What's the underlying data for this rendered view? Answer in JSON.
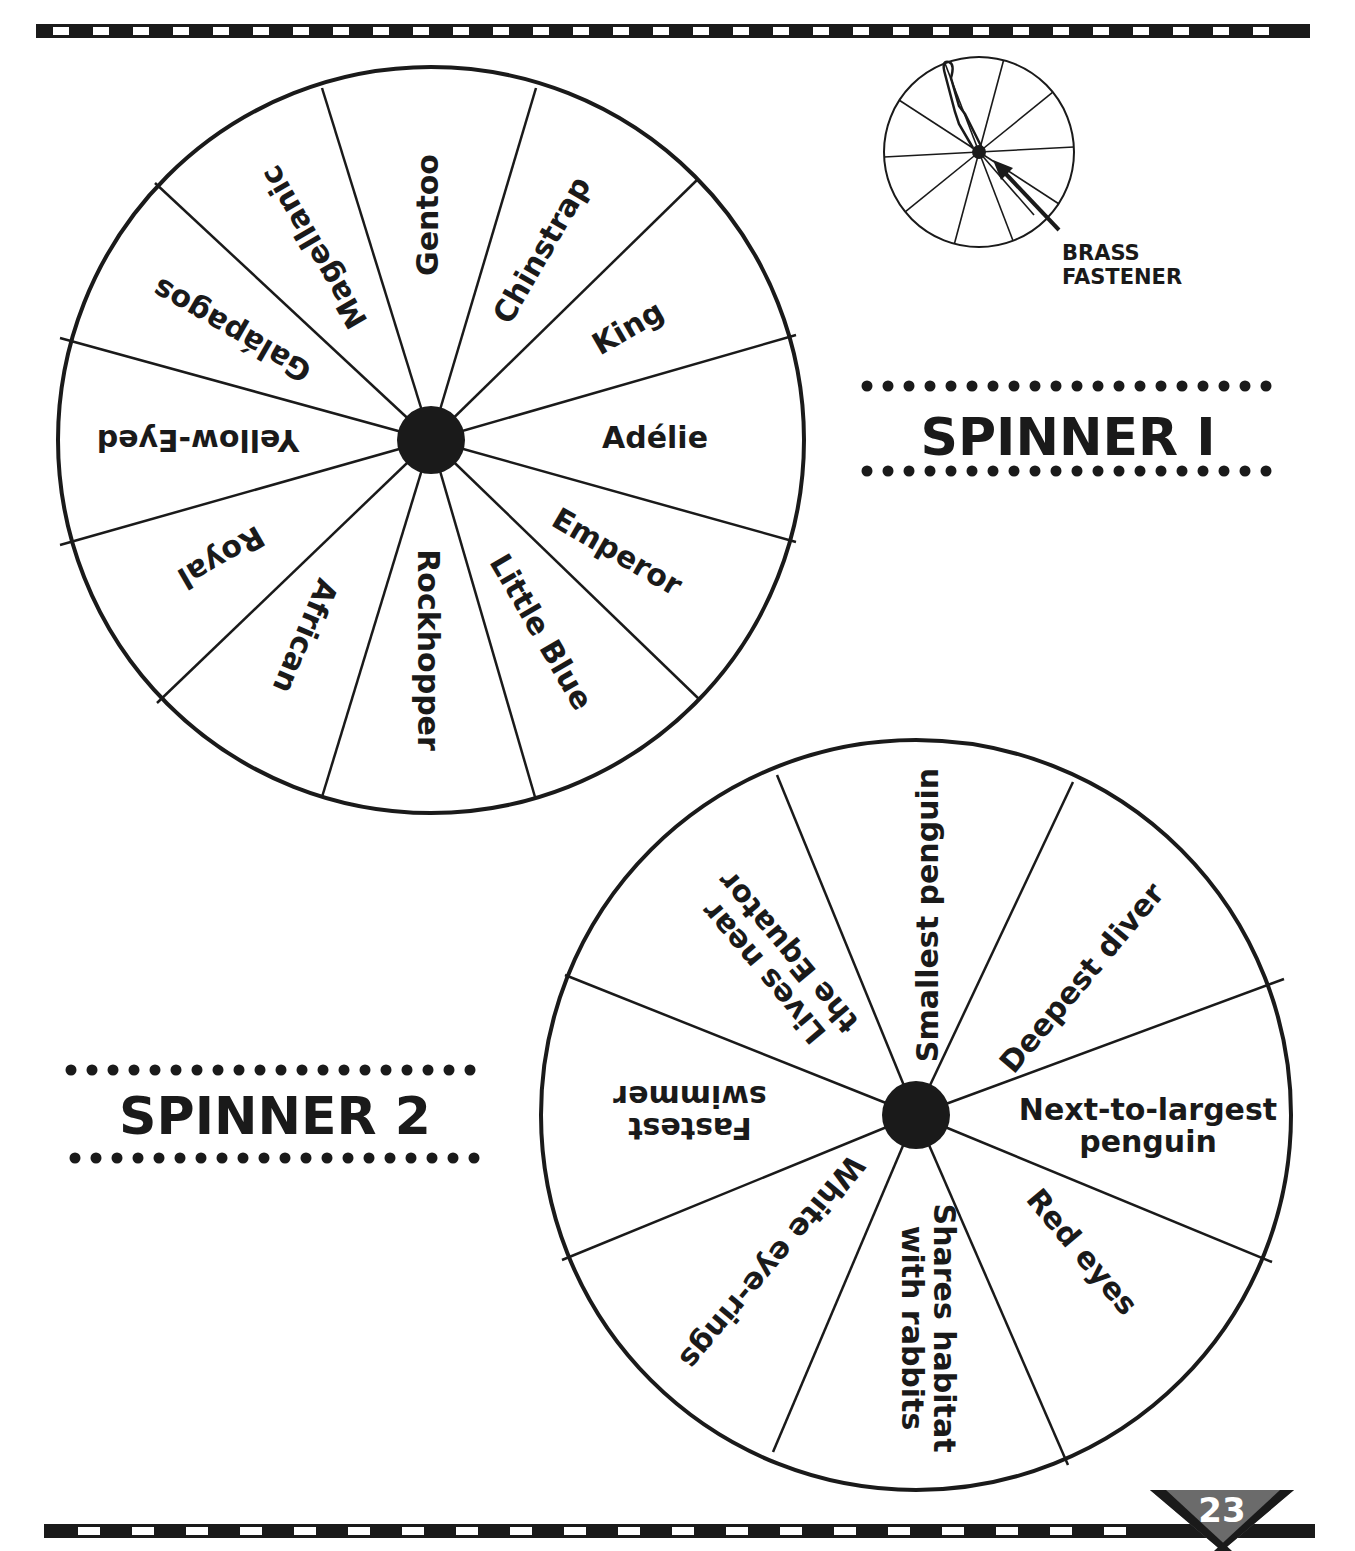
{
  "colors": {
    "ink": "#1a1a1a",
    "paper": "#ffffff",
    "page_badge": "#6b6b6b"
  },
  "top_rule": {
    "x": 36,
    "y": 24,
    "width": 1274,
    "height": 14,
    "dash_start": 53,
    "dash_width": 16,
    "dash_step": 40
  },
  "bottom_rule": {
    "x": 44,
    "y": 1524,
    "width": 1271,
    "height": 14,
    "dash_start": 78,
    "dash_width": 22,
    "dash_step": 54
  },
  "page_number": {
    "label": "23",
    "x": 1222,
    "y": 1522
  },
  "assembly_diagram": {
    "cx": 979,
    "cy": 152,
    "r": 95,
    "label_line1": "BRASS",
    "label_line2": "FASTENER"
  },
  "spinner1": {
    "title": "SPINNER 1",
    "title_display": "SPINNER I",
    "title_pos": {
      "x": 1068,
      "y": 455
    },
    "cx": 431,
    "cy": 440,
    "r": 373,
    "hub_r": 34,
    "boundary_points": [
      [
        322,
        88
      ],
      [
        536,
        88
      ],
      [
        697,
        180
      ],
      [
        796,
        335
      ],
      [
        796,
        542
      ],
      [
        700,
        700
      ],
      [
        535,
        797
      ],
      [
        322,
        797
      ],
      [
        157,
        703
      ],
      [
        60,
        545
      ],
      [
        60,
        338
      ],
      [
        155,
        183
      ]
    ],
    "segments": [
      {
        "label": "Gentoo",
        "x": 428,
        "y": 215,
        "rotate": -90
      },
      {
        "label": "Chinstrap",
        "x": 542,
        "y": 250,
        "rotate": -60
      },
      {
        "label": "King",
        "x": 628,
        "y": 328,
        "rotate": -30
      },
      {
        "label": "Adélie",
        "x": 655,
        "y": 438,
        "rotate": 0
      },
      {
        "label": "Emperor",
        "x": 617,
        "y": 552,
        "rotate": 30
      },
      {
        "label": "Little Blue",
        "x": 541,
        "y": 632,
        "rotate": 60
      },
      {
        "label": "Rockhopper",
        "x": 428,
        "y": 650,
        "rotate": 90
      },
      {
        "label": "African",
        "x": 305,
        "y": 636,
        "rotate": 113
      },
      {
        "label": "Royal",
        "x": 221,
        "y": 557,
        "rotate": 150
      },
      {
        "label": "Yellow-Eyed",
        "x": 198,
        "y": 440,
        "rotate": 180
      },
      {
        "label": "Galápagos",
        "x": 232,
        "y": 330,
        "rotate": 210
      },
      {
        "label": "Magellanic",
        "x": 314,
        "y": 247,
        "rotate": 240
      }
    ]
  },
  "spinner2": {
    "title": "SPINNER 2",
    "title_pos": {
      "x": 275,
      "y": 1134
    },
    "cx": 916,
    "cy": 1115,
    "r": 375,
    "hub_r": 34,
    "boundary_points": [
      [
        777,
        775
      ],
      [
        1073,
        782
      ],
      [
        1284,
        979
      ],
      [
        1272,
        1262
      ],
      [
        1068,
        1465
      ],
      [
        773,
        1452
      ],
      [
        562,
        1260
      ],
      [
        565,
        975
      ]
    ],
    "segments": [
      {
        "lines": [
          "Smallest penguin"
        ],
        "x": 928,
        "y": 915,
        "rotate": -90
      },
      {
        "lines": [
          "Deepest diver"
        ],
        "x": 1082,
        "y": 978,
        "rotate": -50
      },
      {
        "lines": [
          "Next-to-largest",
          "penguin"
        ],
        "x": 1148,
        "y": 1126,
        "rotate": 0
      },
      {
        "lines": [
          "Red eyes"
        ],
        "x": 1082,
        "y": 1252,
        "rotate": 50
      },
      {
        "lines": [
          "Shares habitat",
          "with rabbits"
        ],
        "x": 928,
        "y": 1328,
        "rotate": 90
      },
      {
        "lines": [
          "White eye-rings"
        ],
        "x": 772,
        "y": 1262,
        "rotate": 130
      },
      {
        "lines": [
          "Fastest",
          "swimmer"
        ],
        "x": 690,
        "y": 1112,
        "rotate": 180
      },
      {
        "lines": [
          "Lives near",
          "the Equator"
        ],
        "x": 776,
        "y": 962,
        "rotate": 230
      }
    ]
  }
}
